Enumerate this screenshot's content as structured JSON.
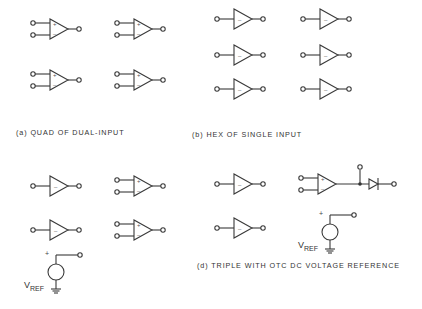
{
  "figure": {
    "panels": [
      {
        "id": "a",
        "caption": "(a) QUAD OF DUAL-INPUT",
        "amplifiers": 4,
        "type": "dual-input"
      },
      {
        "id": "b",
        "caption": "(b) HEX OF SINGLE INPUT",
        "amplifiers": 6,
        "type": "single-input"
      },
      {
        "id": "c",
        "caption": "",
        "amplifiers": 4,
        "type": "mixed single/dual with voltage reference"
      },
      {
        "id": "d",
        "caption": "(d) TRIPLE  WITH OTC DC VOLTAGE REFERENCE",
        "amplifiers": 3,
        "type": "triple with reference"
      }
    ],
    "symbols": {
      "plus": "+",
      "minus": "–",
      "vref_main": "V",
      "vref_sub": "REF",
      "source_plus": "+"
    }
  }
}
